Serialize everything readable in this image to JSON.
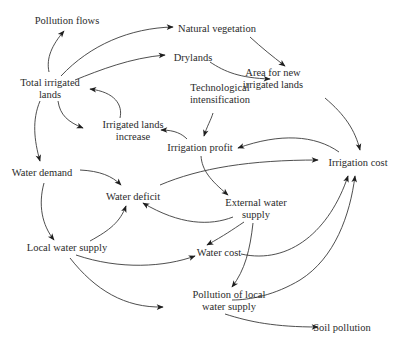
{
  "nodes": [
    {
      "id": "pollution_flows",
      "lines": [
        "Pollution flows"
      ]
    },
    {
      "id": "natural_vegetation",
      "lines": [
        "Natural vegetation"
      ]
    },
    {
      "id": "drylands",
      "lines": [
        "Drylands"
      ]
    },
    {
      "id": "area_new_irrigated",
      "lines": [
        "Area for new",
        "irrigated lands"
      ]
    },
    {
      "id": "total_irrigated",
      "lines": [
        "Total irrigated",
        "lands"
      ]
    },
    {
      "id": "tech_intensification",
      "lines": [
        "Technological",
        "intensification"
      ]
    },
    {
      "id": "irrigated_increase",
      "lines": [
        "Irrigated lands",
        "increase"
      ]
    },
    {
      "id": "irrigation_profit",
      "lines": [
        "Irrigation profit"
      ]
    },
    {
      "id": "irrigation_cost",
      "lines": [
        "Irrigation cost"
      ]
    },
    {
      "id": "water_demand",
      "lines": [
        "Water demand"
      ]
    },
    {
      "id": "water_deficit",
      "lines": [
        "Water deficit"
      ]
    },
    {
      "id": "external_water",
      "lines": [
        "External water",
        "supply"
      ]
    },
    {
      "id": "local_water",
      "lines": [
        "Local water supply"
      ]
    },
    {
      "id": "water_cost",
      "lines": [
        "Water cost"
      ]
    },
    {
      "id": "pollution_local",
      "lines": [
        "Pollution of local",
        "water supply"
      ]
    },
    {
      "id": "soil_pollution",
      "lines": [
        "Soil pollution"
      ]
    }
  ],
  "edges": [
    {
      "from": "total_irrigated",
      "to": "pollution_flows"
    },
    {
      "from": "total_irrigated",
      "to": "natural_vegetation"
    },
    {
      "from": "total_irrigated",
      "to": "drylands"
    },
    {
      "from": "natural_vegetation",
      "to": "area_new_irrigated"
    },
    {
      "from": "drylands",
      "to": "area_new_irrigated"
    },
    {
      "from": "area_new_irrigated",
      "to": "irrigation_cost"
    },
    {
      "from": "total_irrigated",
      "to": "irrigated_increase"
    },
    {
      "from": "irrigated_increase",
      "to": "total_irrigated"
    },
    {
      "from": "tech_intensification",
      "to": "irrigation_profit"
    },
    {
      "from": "irrigation_profit",
      "to": "irrigated_increase"
    },
    {
      "from": "irrigation_cost",
      "to": "irrigation_profit"
    },
    {
      "from": "irrigation_profit",
      "to": "external_water"
    },
    {
      "from": "total_irrigated",
      "to": "water_demand"
    },
    {
      "from": "water_demand",
      "to": "water_deficit"
    },
    {
      "from": "water_deficit",
      "to": "irrigation_cost"
    },
    {
      "from": "water_demand",
      "to": "local_water"
    },
    {
      "from": "local_water",
      "to": "water_deficit"
    },
    {
      "from": "external_water",
      "to": "water_deficit"
    },
    {
      "from": "external_water",
      "to": "water_cost"
    },
    {
      "from": "external_water",
      "to": "pollution_local"
    },
    {
      "from": "local_water",
      "to": "water_cost"
    },
    {
      "from": "local_water",
      "to": "pollution_local"
    },
    {
      "from": "water_cost",
      "to": "irrigation_cost"
    },
    {
      "from": "pollution_local",
      "to": "irrigation_cost"
    },
    {
      "from": "pollution_local",
      "to": "soil_pollution"
    }
  ]
}
